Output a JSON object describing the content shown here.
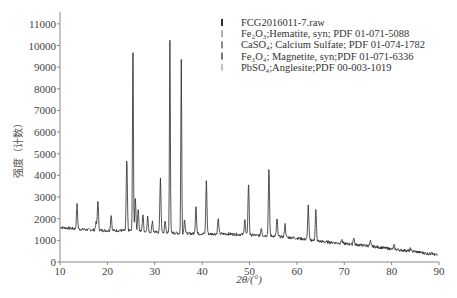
{
  "chart_data": {
    "type": "line",
    "title": "",
    "xlabel": "2θ/(°)",
    "ylabel": "强度（计数）",
    "xlim": [
      10,
      90
    ],
    "ylim": [
      0,
      11500
    ],
    "x_ticks": [
      10,
      20,
      30,
      40,
      50,
      60,
      70,
      80,
      90
    ],
    "y_ticks": [
      0,
      1000,
      2000,
      3000,
      4000,
      5000,
      6000,
      7000,
      8000,
      9000,
      10000,
      11000
    ],
    "grid": false,
    "legend_position": "upper right",
    "legend": [
      {
        "label": "FCG2016011-7.raw",
        "color": "#333333"
      },
      {
        "label": "Fe₂O₃;Hematite, syn; PDF 01-071-5088",
        "color": "#b0b0b0"
      },
      {
        "label": "CaSO₄; Calcium Sulfate; PDF 01-074-1782",
        "color": "#8a8a8a"
      },
      {
        "label": "Fe₃O₄; Magnetite, syn;PDF 01-071-6336",
        "color": "#777777"
      },
      {
        "label": "PbSO₄;Anglesite;PDF 00-003-1019",
        "color": "#c0c0c0"
      }
    ],
    "series": [
      {
        "name": "FCG2016011-7.raw",
        "baseline": [
          [
            10,
            1600
          ],
          [
            15,
            1500
          ],
          [
            20,
            1450
          ],
          [
            25,
            1450
          ],
          [
            30,
            1380
          ],
          [
            35,
            1330
          ],
          [
            40,
            1300
          ],
          [
            45,
            1300
          ],
          [
            50,
            1250
          ],
          [
            55,
            1200
          ],
          [
            60,
            1100
          ],
          [
            65,
            950
          ],
          [
            70,
            850
          ],
          [
            75,
            750
          ],
          [
            80,
            600
          ],
          [
            85,
            480
          ],
          [
            90,
            300
          ]
        ],
        "peaks": [
          {
            "x": 13.6,
            "y": 2650
          },
          {
            "x": 17.6,
            "y": 1800
          },
          {
            "x": 18.0,
            "y": 2850
          },
          {
            "x": 20.8,
            "y": 2200
          },
          {
            "x": 24.1,
            "y": 4700
          },
          {
            "x": 25.4,
            "y": 10500
          },
          {
            "x": 25.9,
            "y": 3000
          },
          {
            "x": 26.5,
            "y": 2500
          },
          {
            "x": 27.5,
            "y": 2200
          },
          {
            "x": 28.5,
            "y": 2100
          },
          {
            "x": 29.5,
            "y": 1900
          },
          {
            "x": 31.2,
            "y": 3900
          },
          {
            "x": 32.2,
            "y": 1900
          },
          {
            "x": 33.2,
            "y": 10300
          },
          {
            "x": 35.6,
            "y": 9350
          },
          {
            "x": 36.3,
            "y": 2000
          },
          {
            "x": 38.7,
            "y": 2600
          },
          {
            "x": 40.9,
            "y": 3750
          },
          {
            "x": 43.4,
            "y": 2000
          },
          {
            "x": 49.0,
            "y": 2000
          },
          {
            "x": 49.8,
            "y": 3650
          },
          {
            "x": 52.5,
            "y": 1600
          },
          {
            "x": 54.1,
            "y": 4300
          },
          {
            "x": 55.8,
            "y": 2000
          },
          {
            "x": 57.5,
            "y": 1750
          },
          {
            "x": 62.4,
            "y": 2600
          },
          {
            "x": 64.0,
            "y": 2400
          },
          {
            "x": 69.5,
            "y": 1050
          },
          {
            "x": 72.0,
            "y": 1150
          },
          {
            "x": 75.5,
            "y": 950
          },
          {
            "x": 80.5,
            "y": 780
          },
          {
            "x": 84.0,
            "y": 620
          },
          {
            "x": 88.5,
            "y": 500
          }
        ]
      }
    ]
  },
  "legend": {
    "raw": "FCG2016011-7.raw",
    "hematite": "Fe₂O₃;Hematite, syn; PDF 01-071-5088",
    "caso4": "CaSO₄; Calcium Sulfate; PDF 01-074-1782",
    "magnetite": "Fe₃O₄; Magnetite, syn;PDF 01-071-6336",
    "anglesite": "PbSO₄;Anglesite;PDF 00-003-1019"
  },
  "axes": {
    "xlabel": "2θ/(°)",
    "ylabel": "强度（计数）"
  }
}
